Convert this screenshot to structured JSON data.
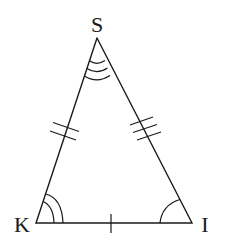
{
  "diagram": {
    "type": "isosceles-triangle",
    "vertices": [
      {
        "name": "S",
        "x": 97,
        "y": 38,
        "label_x": 97,
        "label_y": 32,
        "angle_arcs": 3
      },
      {
        "name": "K",
        "x": 36,
        "y": 223,
        "label_x": 22,
        "label_y": 232,
        "angle_arcs": 2
      },
      {
        "name": "I",
        "x": 192,
        "y": 223,
        "label_x": 205,
        "label_y": 232,
        "angle_arcs": 1
      }
    ],
    "sides": [
      {
        "name": "SK",
        "tick_marks": 2
      },
      {
        "name": "SI",
        "tick_marks": 3
      },
      {
        "name": "KI",
        "tick_marks": 1
      }
    ],
    "stroke_color": "#1a1a1a",
    "background_color": "#ffffff"
  }
}
